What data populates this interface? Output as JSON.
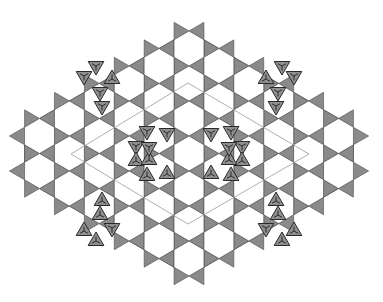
{
  "diagram": {
    "title": "",
    "type": "kagome-tiling-with-defects",
    "colors": {
      "background": "#ffffff",
      "triangle_fill": "#8a8a8a",
      "triangle_stroke": "#4a4a4a",
      "defect_fill": "#8f8f8f",
      "defect_stroke": "#2a2a2a",
      "hexagon_fill": "#ffffff",
      "unit_cell_line": "#9a9a9a"
    },
    "lattice": {
      "center_x": 189,
      "center_y": 153.5,
      "column_spacing": 29.9,
      "row_spacing": 35,
      "hex_side": 17.5,
      "max_extent": 3
    },
    "unit_cell_rhombus": [
      [
        188,
        83
      ],
      [
        309,
        154
      ],
      [
        188,
        224
      ],
      [
        71,
        154
      ]
    ],
    "defect_triangles_quadrant": [
      [
        96,
        66
      ],
      [
        84,
        76
      ],
      [
        112,
        79
      ],
      [
        100,
        92
      ],
      [
        102,
        106
      ],
      [
        147,
        131
      ],
      [
        136,
        146
      ],
      [
        149,
        160
      ],
      [
        167,
        133
      ]
    ],
    "defect_triangle_size": 9
  }
}
